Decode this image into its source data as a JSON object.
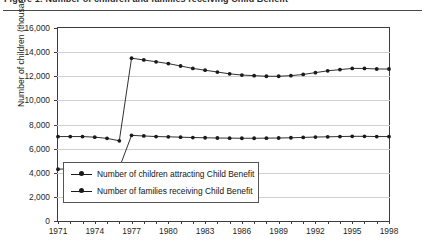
{
  "figure": {
    "title": "Figure 1: Number of children and families receiving Child Benefit",
    "ytitle": "Number of children (thousands)"
  },
  "legend": {
    "items": [
      {
        "label": "Number of children attracting Child Benefit",
        "marker": "line-dot-marker"
      },
      {
        "label": "Number of families receiving Child Benefit",
        "marker": "line-dot-marker"
      }
    ]
  },
  "axes": {
    "y_ticks": [
      "16,000",
      "14,000",
      "12,000",
      "10,000",
      "8,000",
      "6,000",
      "4,000",
      "2,000",
      "0"
    ],
    "x_ticks": [
      "1971",
      "1974",
      "1977",
      "1980",
      "1983",
      "1986",
      "1989",
      "1992",
      "1995",
      "1998"
    ]
  },
  "chart_data": {
    "type": "line",
    "title": "Figure 1: Number of children and families receiving Child Benefit",
    "xlabel": "",
    "ylabel": "Number of children (thousands)",
    "ylim": [
      0,
      16000
    ],
    "ytick_step": 2000,
    "xlim": [
      1971,
      1998
    ],
    "grid": true,
    "legend_position": "inside-lower-left",
    "x": [
      1971,
      1972,
      1973,
      1974,
      1975,
      1976,
      1977,
      1978,
      1979,
      1980,
      1981,
      1982,
      1983,
      1984,
      1985,
      1986,
      1987,
      1988,
      1989,
      1990,
      1991,
      1992,
      1993,
      1994,
      1995,
      1996,
      1997,
      1998
    ],
    "series": [
      {
        "name": "Number of children attracting Child Benefit",
        "color": "#1a1a1a",
        "values": [
          7000,
          7000,
          7000,
          6950,
          6850,
          6650,
          13500,
          13350,
          13200,
          13050,
          12850,
          12650,
          12500,
          12350,
          12200,
          12100,
          12050,
          12000,
          12000,
          12050,
          12150,
          12300,
          12450,
          12550,
          12650,
          12650,
          12600,
          12600
        ]
      },
      {
        "name": "Number of families receiving Child Benefit",
        "color": "#1a1a1a",
        "values": [
          4300,
          4320,
          4350,
          4380,
          4400,
          4400,
          7100,
          7050,
          7000,
          6980,
          6950,
          6920,
          6900,
          6880,
          6870,
          6860,
          6860,
          6870,
          6880,
          6900,
          6930,
          6960,
          6980,
          7000,
          7020,
          7020,
          7000,
          7000
        ]
      }
    ]
  }
}
